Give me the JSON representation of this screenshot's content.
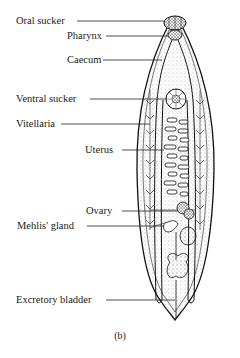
{
  "diagram": {
    "caption": "(b)",
    "labels": [
      {
        "id": "oral-sucker",
        "text": "Oral sucker"
      },
      {
        "id": "pharynx",
        "text": "Pharynx"
      },
      {
        "id": "caecum",
        "text": "Caecum"
      },
      {
        "id": "ventral-sucker",
        "text": "Ventral sucker"
      },
      {
        "id": "vitellaria",
        "text": "Vitellaria"
      },
      {
        "id": "uterus",
        "text": "Uterus"
      },
      {
        "id": "ovary",
        "text": "Ovary"
      },
      {
        "id": "mehlis-gland",
        "text": "Mehlis' gland"
      },
      {
        "id": "excretory-bladder",
        "text": "Excretory bladder"
      }
    ]
  }
}
